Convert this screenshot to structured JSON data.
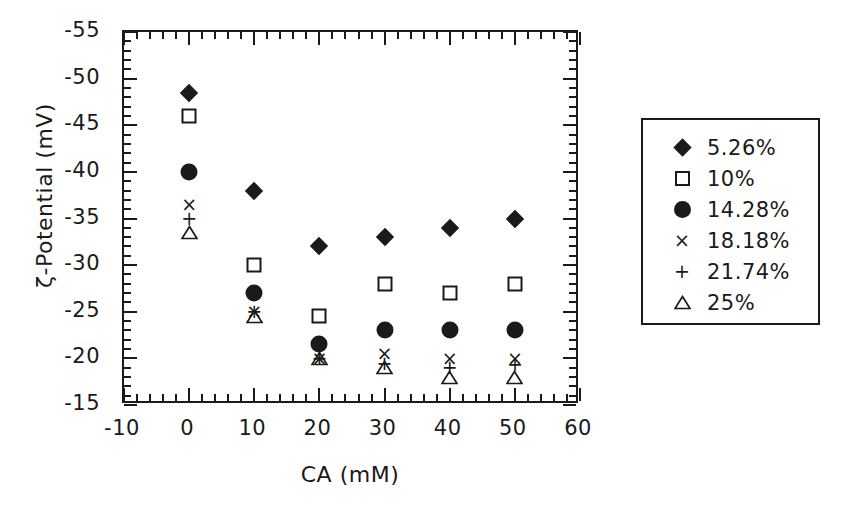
{
  "chart_data": {
    "type": "scatter",
    "title": "",
    "xlabel": "CA (mM)",
    "ylabel": "ζ-Potential (mV)",
    "xlim": [
      -10,
      60
    ],
    "ylim": [
      -55,
      -15
    ],
    "y_axis_inverted": true,
    "grid": false,
    "legend_position": "right-outside",
    "x_ticks": [
      "-10",
      "0",
      "10",
      "20",
      "30",
      "40",
      "50",
      "60"
    ],
    "x_tick_values": [
      -10,
      0,
      10,
      20,
      30,
      40,
      50,
      60
    ],
    "x_minor_tick_step": 2,
    "y_ticks": [
      "-55",
      "-50",
      "-45",
      "-40",
      "-35",
      "-30",
      "-25",
      "-20",
      "-15"
    ],
    "y_tick_values": [
      -55,
      -50,
      -45,
      -40,
      -35,
      -30,
      -25,
      -20,
      -15
    ],
    "y_minor_tick_step": 1,
    "x": [
      0,
      10,
      20,
      30,
      40,
      50
    ],
    "series": [
      {
        "name": "5.26%",
        "marker": "filled-diamond",
        "values": [
          -48.5,
          -38.0,
          -32.0,
          -33.0,
          -34.0,
          -35.0
        ]
      },
      {
        "name": "10%",
        "marker": "open-square",
        "values": [
          -46.0,
          -30.0,
          -24.5,
          -28.0,
          -27.0,
          -28.0
        ]
      },
      {
        "name": "14.28%",
        "marker": "filled-circle",
        "values": [
          -40.0,
          -27.0,
          -21.5,
          -23.0,
          -23.0,
          -23.0
        ]
      },
      {
        "name": "18.18%",
        "marker": "cross",
        "values": [
          -36.5,
          -25.0,
          -20.0,
          -20.5,
          -20.0,
          -20.0
        ]
      },
      {
        "name": "21.74%",
        "marker": "plus",
        "values": [
          -35.0,
          -25.0,
          -20.0,
          -19.5,
          -19.0,
          -19.3
        ]
      },
      {
        "name": "25%",
        "marker": "open-triangle",
        "values": [
          -33.5,
          -24.5,
          -20.0,
          -19.0,
          -18.0,
          -18.0
        ]
      }
    ]
  },
  "legend": {
    "entries": [
      {
        "symbol": "filled-diamond",
        "label": "5.26%"
      },
      {
        "symbol": "open-square",
        "label": "10%"
      },
      {
        "symbol": "filled-circle",
        "label": "14.28%"
      },
      {
        "symbol": "cross",
        "label": "18.18%"
      },
      {
        "symbol": "plus",
        "label": "21.74%"
      },
      {
        "symbol": "open-triangle",
        "label": "25%"
      }
    ]
  },
  "colors": {
    "ink": "#1a1a1a",
    "background": "#ffffff"
  }
}
